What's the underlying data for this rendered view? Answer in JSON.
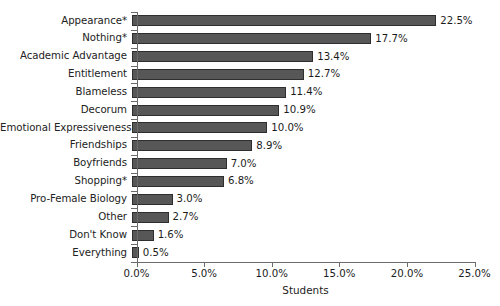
{
  "chart_data": {
    "type": "bar",
    "orientation": "horizontal",
    "title": "",
    "xlabel": "Students",
    "ylabel": "",
    "xlim": [
      0,
      25
    ],
    "grid": false,
    "legend": null,
    "bar_color": "#575757",
    "bar_edge_color": "#2e2e2e",
    "axis_color": "#6b6b6b",
    "categories": [
      "Appearance*",
      "Nothing*",
      "Academic Advantage",
      "Entitlement",
      "Blameless",
      "Decorum",
      "Emotional Expressiveness",
      "Friendships",
      "Boyfriends",
      "Shopping*",
      "Pro-Female Biology",
      "Other",
      "Don't Know",
      "Everything"
    ],
    "values": [
      22.5,
      17.7,
      13.4,
      12.7,
      11.4,
      10.9,
      10.0,
      8.9,
      7.0,
      6.8,
      3.0,
      2.7,
      1.6,
      0.5
    ],
    "value_labels": [
      "22.5%",
      "17.7%",
      "13.4%",
      "12.7%",
      "11.4%",
      "10.9%",
      "10.0%",
      "8.9%",
      "7.0%",
      "6.8%",
      "3.0%",
      "2.7%",
      "1.6%",
      "0.5%"
    ],
    "xticks": [
      0,
      5,
      10,
      15,
      20,
      25
    ],
    "xtick_labels": [
      "0.0%",
      "5.0%",
      "10.0%",
      "15.0%",
      "20.0%",
      "25.0%"
    ]
  },
  "footnote": ""
}
